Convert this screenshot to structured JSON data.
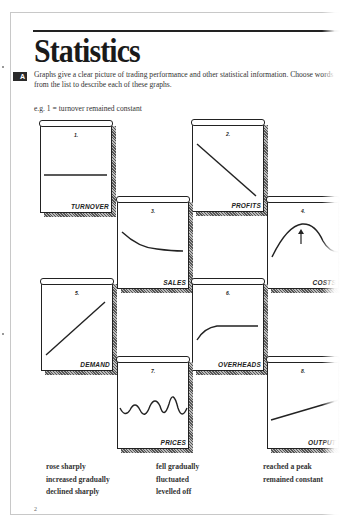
{
  "page": {
    "title": "Statistics",
    "section_badge": "A",
    "instructions": "Graphs give a clear picture of trading performance and other statistical information. Choose words from the list to describe each of these graphs.",
    "example": "e.g. 1 = turnover remained constant",
    "page_number": "2"
  },
  "graphs": [
    {
      "number": "1.",
      "label": "TURNOVER",
      "shape": "flat-line"
    },
    {
      "number": "2.",
      "label": "PROFITS",
      "shape": "steep-decline"
    },
    {
      "number": "3.",
      "label": "SALES",
      "shape": "gradual-decline"
    },
    {
      "number": "4.",
      "label": "COSTS",
      "shape": "peak-with-arrow"
    },
    {
      "number": "5.",
      "label": "DEMAND",
      "shape": "steep-rise"
    },
    {
      "number": "6.",
      "label": "OVERHEADS",
      "shape": "rise-then-level"
    },
    {
      "number": "7.",
      "label": "PRICES",
      "shape": "wave"
    },
    {
      "number": "8.",
      "label": "OUTPUT",
      "shape": "gradual-rise"
    }
  ],
  "word_list": {
    "column_1": [
      "rose sharply",
      "increased gradually",
      "declined sharply"
    ],
    "column_2": [
      "fell gradually",
      "fluctuated",
      "levelled off"
    ],
    "column_3": [
      "reached a peak",
      "remained constant"
    ]
  }
}
